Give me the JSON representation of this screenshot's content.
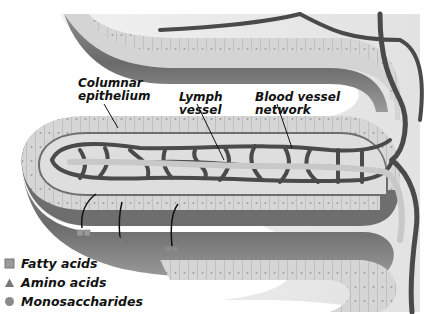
{
  "labels": {
    "columnar_epithelium": [
      "Columnar",
      "epithelium"
    ],
    "lymph_vessel": [
      "Lymph",
      "vessel"
    ],
    "blood_vessel_network": [
      "Blood vessel",
      "network"
    ]
  },
  "legend": [
    {
      "icon": "square-icon",
      "label": "Fatty acids"
    },
    {
      "icon": "triangle-icon",
      "label": "Amino acids"
    },
    {
      "icon": "circle-icon",
      "label": "Monosaccharides"
    }
  ],
  "colors": {
    "tissue_light": "#dcdcdc",
    "tissue_mid": "#a9a9a9",
    "tissue_dark": "#6e6e6e",
    "vessel": "#4f4f4f",
    "lymph": "#cfcfcf"
  }
}
